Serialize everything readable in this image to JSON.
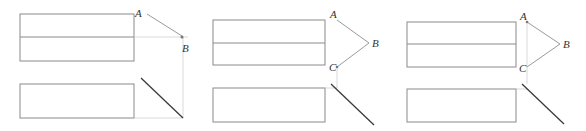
{
  "figure": {
    "panels": [
      {
        "id": "panel-1",
        "labels": {
          "A": "A",
          "B": "B"
        }
      },
      {
        "id": "panel-2",
        "labels": {
          "A": "A",
          "B": "B",
          "C": "C"
        }
      },
      {
        "id": "panel-3",
        "labels": {
          "A": "A",
          "B": "B",
          "C": "C"
        }
      }
    ],
    "colors": {
      "outline": "#8a8a8a",
      "projection": "#cfcfcf",
      "diagonal": "#3a3a3a"
    }
  }
}
